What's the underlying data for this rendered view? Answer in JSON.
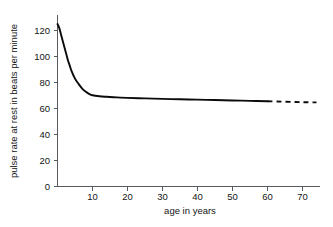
{
  "chart_data": {
    "type": "line",
    "title": "",
    "xlabel": "age in years",
    "ylabel": "pulse rate at rest in beats per minute",
    "xlim": [
      0,
      75
    ],
    "ylim": [
      0,
      130
    ],
    "xticks": [
      10,
      20,
      30,
      40,
      50,
      60,
      70
    ],
    "yticks": [
      0,
      20,
      40,
      60,
      80,
      100,
      120
    ],
    "xtick_labels": [
      "10",
      "20",
      "30",
      "40",
      "50",
      "60",
      "70"
    ],
    "ytick_labels": [
      "0",
      "20",
      "40",
      "60",
      "80",
      "100",
      "120"
    ],
    "grid": false,
    "legend": null,
    "series": [
      {
        "name": "pulse rate at rest",
        "style": "solid",
        "color": "#0b0b0b",
        "x": [
          0,
          0.5,
          1,
          1.5,
          2,
          2.5,
          3,
          3.5,
          4,
          5,
          6,
          7,
          8,
          9,
          10,
          12,
          14,
          16,
          18,
          20,
          25,
          30,
          35,
          40,
          45,
          50,
          55,
          60
        ],
        "y": [
          125,
          122,
          117,
          112,
          107,
          102,
          97,
          93,
          89,
          83,
          79,
          75.5,
          73,
          71.3,
          70.2,
          69.4,
          69,
          68.7,
          68.4,
          68.2,
          67.8,
          67.4,
          67.1,
          66.8,
          66.5,
          66.2,
          65.9,
          65.6
        ]
      },
      {
        "name": "extrapolated",
        "style": "dashed",
        "color": "#0b0b0b",
        "x": [
          60,
          64,
          68,
          71,
          74
        ],
        "y": [
          65.6,
          65.3,
          65.0,
          64.8,
          64.7
        ]
      }
    ],
    "annotations": []
  },
  "axes": {
    "y_axis_title": "pulse rate at rest in beats per minute",
    "x_axis_title": "age in years"
  }
}
